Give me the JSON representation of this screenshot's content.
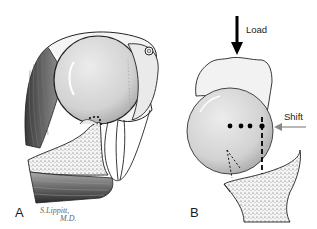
{
  "figure": {
    "panels": [
      {
        "id": "A",
        "label": "A",
        "description": "Shoulder anatomy cross-section with humeral head, glenoid, muscles and capsule"
      },
      {
        "id": "B",
        "label": "B",
        "description": "Humeral head on glenoid under load with shift force"
      }
    ],
    "signature": {
      "line1": "S.Lippitt,",
      "line2": "M.D."
    },
    "annotations": {
      "load": "Load",
      "shift": "Shift"
    },
    "colors": {
      "background": "#ffffff",
      "head_fill": "#d8d8d8",
      "outline": "#1a1a1a",
      "muscle_dark": "#555555",
      "bone_fill": "#eeeeee",
      "arrow_shift": "#888888"
    }
  }
}
